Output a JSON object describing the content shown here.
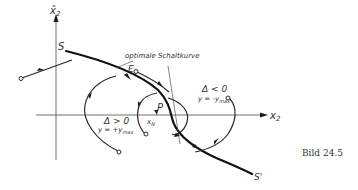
{
  "axes": {
    "y_label": "x̂",
    "y_subscript": "2",
    "x_label": "x",
    "x_subscript": "2"
  },
  "switching_curve": {
    "start_label": "S",
    "end_label": "S'",
    "annotation": "optimale Schaltkurve"
  },
  "points": {
    "E": "E",
    "P": "P",
    "x_label": "x",
    "x_subscript": "N"
  },
  "regions": {
    "positive": {
      "condition": "Δ > 0",
      "control": "y = +y",
      "control_subscript": "max"
    },
    "negative": {
      "condition": "Δ < 0",
      "control": "y = -y",
      "control_subscript": "max"
    }
  },
  "caption": "Bild 24.5",
  "colors": {
    "ink": "#2a2a2a",
    "background": "#ffffff"
  }
}
